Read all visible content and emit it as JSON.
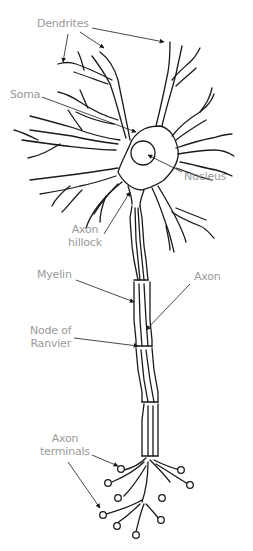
{
  "diagram": {
    "type": "labeled anatomical diagram",
    "stroke_color": "#1a1a1a",
    "label_color": "#9a9a9a",
    "labels": [
      {
        "id": "dendrites",
        "line1": "Dendrites",
        "line2": ""
      },
      {
        "id": "soma",
        "line1": "Soma",
        "line2": ""
      },
      {
        "id": "nucleus",
        "line1": "Nucleus",
        "line2": ""
      },
      {
        "id": "axon_hillock",
        "line1": "Axon",
        "line2": "hillock"
      },
      {
        "id": "myelin",
        "line1": "Myelin",
        "line2": ""
      },
      {
        "id": "axon",
        "line1": "Axon",
        "line2": ""
      },
      {
        "id": "node_of_ranvier",
        "line1": "Node of",
        "line2": "Ranvier"
      },
      {
        "id": "axon_terminals",
        "line1": "Axon",
        "line2": "terminals"
      }
    ]
  }
}
